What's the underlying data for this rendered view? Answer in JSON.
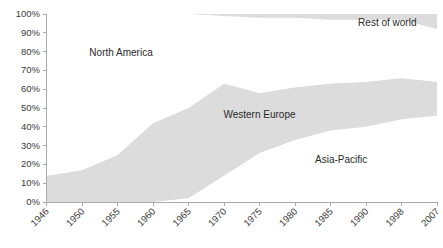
{
  "chart_data": {
    "type": "area",
    "stacked": "100%",
    "title": "",
    "subtitle": "",
    "xlabel": "",
    "ylabel": "",
    "grid": false,
    "legend_position": "inline-labels",
    "ylim": [
      0,
      100
    ],
    "ytick_labels": [
      "0%",
      "10%",
      "20%",
      "30%",
      "40%",
      "50%",
      "60%",
      "70%",
      "80%",
      "90%",
      "100%"
    ],
    "ytick_values": [
      0,
      10,
      20,
      30,
      40,
      50,
      60,
      70,
      80,
      90,
      100
    ],
    "categories": [
      "1946",
      "1950",
      "1955",
      "1960",
      "1965",
      "1970",
      "1975",
      "1980",
      "1985",
      "1990",
      "1998",
      "2007"
    ],
    "x_positions": [
      0,
      1,
      2,
      3,
      4,
      5,
      6,
      7,
      8,
      9,
      10,
      11
    ],
    "colors": {
      "band_gray": "#dcdcdc",
      "band_white": "#ffffff",
      "axis": "#aaaaaa",
      "text": "#3b3b3b"
    },
    "series": [
      {
        "name": "Asia-Pacific",
        "fill": "white",
        "order": 1,
        "values": [
          0,
          0,
          0,
          0,
          2,
          14,
          26,
          33,
          38,
          40,
          44,
          46
        ],
        "label_x": 8.3,
        "label_y": 22
      },
      {
        "name": "Western Europe",
        "fill": "gray",
        "order": 2,
        "values": [
          14,
          17,
          25,
          42,
          48,
          49,
          32,
          28,
          25,
          24,
          22,
          18
        ],
        "label_x": 6.0,
        "label_y": 46
      },
      {
        "name": "North America",
        "fill": "white",
        "order": 3,
        "values": [
          86,
          83,
          75,
          58,
          50,
          36,
          40,
          37,
          34,
          33,
          31,
          28
        ],
        "label_x": 2.1,
        "label_y": 79
      },
      {
        "name": "Rest of world",
        "fill": "gray",
        "order": 4,
        "values": [
          0,
          0,
          0,
          0,
          0,
          1,
          2,
          2,
          3,
          3,
          3,
          8
        ],
        "label_x": 9.6,
        "label_y": 95
      }
    ],
    "cumulative_boundaries": {
      "asia_pacific_top": [
        0,
        0,
        0,
        0,
        2,
        14,
        26,
        33,
        38,
        40,
        44,
        46
      ],
      "western_europe_top": [
        14,
        17,
        25,
        42,
        50,
        63,
        58,
        61,
        63,
        64,
        66,
        64
      ],
      "north_america_top": [
        100,
        100,
        100,
        100,
        100,
        99,
        98,
        98,
        97,
        97,
        97,
        92
      ],
      "rest_of_world_top": [
        100,
        100,
        100,
        100,
        100,
        100,
        100,
        100,
        100,
        100,
        100,
        100
      ]
    }
  }
}
